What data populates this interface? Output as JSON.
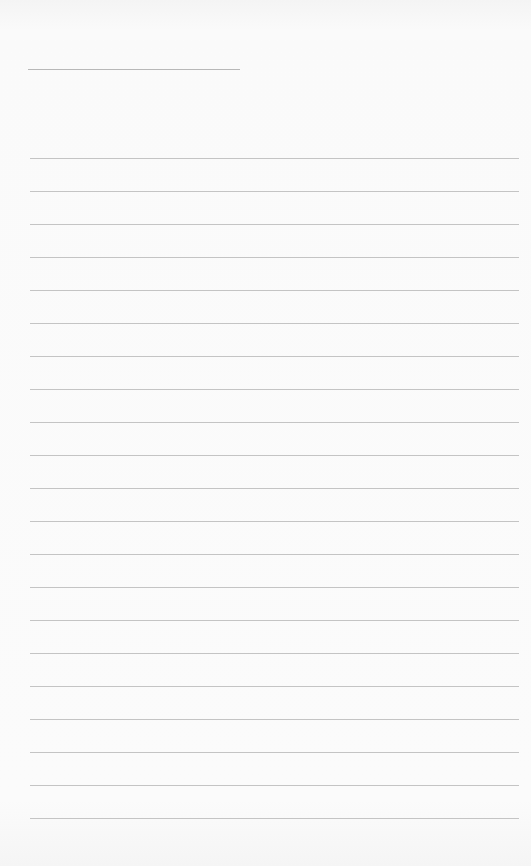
{
  "page": {
    "type": "lined-paper",
    "background_color": "#f8f8f8",
    "line_color": "#c4c4c4"
  },
  "title_line": {
    "x": 28,
    "y": 69,
    "width": 212
  },
  "ruled_lines": {
    "count": 21,
    "start_y": 158,
    "spacing": 33,
    "left": 30,
    "width": 489
  }
}
